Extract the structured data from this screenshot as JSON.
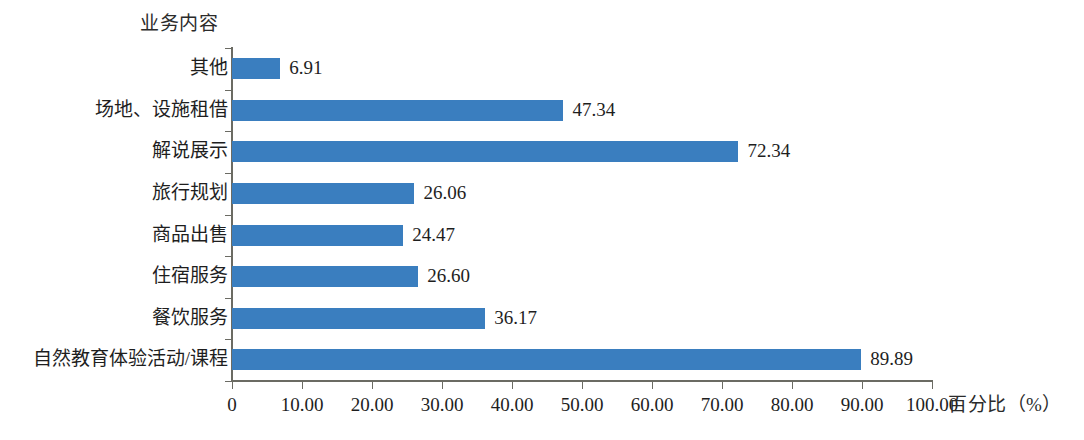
{
  "chart_data": {
    "type": "bar",
    "orientation": "horizontal",
    "title": "业务内容",
    "xlabel": "百分比（%）",
    "ylabel": "业务内容",
    "xlim": [
      0,
      100
    ],
    "grid": false,
    "legend": null,
    "categories": [
      "其他",
      "场地、设施租借",
      "解说展示",
      "旅行规划",
      "商品出售",
      "住宿服务",
      "餐饮服务",
      "自然教育体验活动/课程"
    ],
    "values": [
      6.91,
      47.34,
      72.34,
      26.06,
      24.47,
      26.6,
      36.17,
      89.89
    ],
    "value_labels": [
      "6.91",
      "47.34",
      "72.34",
      "26.06",
      "24.47",
      "26.60",
      "36.17",
      "89.89"
    ],
    "xticks": [
      0,
      10,
      20,
      30,
      40,
      50,
      60,
      70,
      80,
      90,
      100
    ],
    "xtick_labels": [
      "0",
      "10.00",
      "20.00",
      "30.00",
      "40.00",
      "50.00",
      "60.00",
      "70.00",
      "80.00",
      "90.00",
      "100.00"
    ],
    "series_color": "#3a7ebf",
    "axis_color": "#6b6b63",
    "background_color": "#ffffff"
  }
}
